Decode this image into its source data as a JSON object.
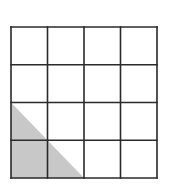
{
  "diagram": {
    "type": "grid-with-shaded-triangle",
    "grid": {
      "rows": 4,
      "cols": 4,
      "x": 11,
      "y": 27,
      "width": 146,
      "height": 151,
      "stroke_color": "#2a2a2a",
      "stroke_width": 1.6,
      "background": "#ffffff"
    },
    "shaded_region": {
      "shape": "right-triangle",
      "description": "Right triangle in bottom-left of grid: vertices at top-left of row 3, bottom-left corner, and bottom edge at column 2",
      "vertices_grid_units": [
        [
          0,
          2
        ],
        [
          0,
          4
        ],
        [
          2,
          4
        ]
      ],
      "fill_color": "#c8c8c8"
    }
  }
}
